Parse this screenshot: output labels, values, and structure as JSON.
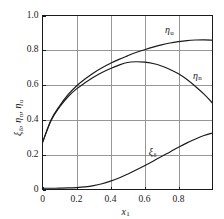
{
  "chart_data": {
    "type": "line",
    "title": "",
    "subtitle": "",
    "xlabel": "x₁",
    "ylabel": "ξδ, ηn, ηu",
    "xlim": [
      0,
      1
    ],
    "ylim": [
      0,
      1
    ],
    "grid": true,
    "legend_position": "inline-curve-labels",
    "xticks": [
      "0",
      "0.2",
      "0.4",
      "0.6",
      "0.8"
    ],
    "xtick_values": [
      0,
      0.2,
      0.4,
      0.6,
      0.8
    ],
    "yticks": [
      "0",
      "0.2",
      "0.4",
      "0.6",
      "0.8",
      "1.0"
    ],
    "ytick_values": [
      0,
      0.2,
      0.4,
      0.6,
      0.8,
      1.0
    ],
    "x": [
      0,
      0.05,
      0.1,
      0.15,
      0.2,
      0.25,
      0.3,
      0.35,
      0.4,
      0.45,
      0.5,
      0.55,
      0.6,
      0.65,
      0.7,
      0.75,
      0.8,
      0.85,
      0.9,
      0.95,
      1.0
    ],
    "series": [
      {
        "name": "ηu",
        "label": "η",
        "label_sub": "u",
        "values": [
          0.27,
          0.4,
          0.48,
          0.545,
          0.595,
          0.635,
          0.67,
          0.7,
          0.725,
          0.748,
          0.768,
          0.787,
          0.803,
          0.818,
          0.831,
          0.842,
          0.85,
          0.856,
          0.859,
          0.86,
          0.858
        ]
      },
      {
        "name": "ηn",
        "label": "η",
        "label_sub": "n",
        "values": [
          0.27,
          0.395,
          0.473,
          0.533,
          0.578,
          0.613,
          0.645,
          0.672,
          0.695,
          0.715,
          0.73,
          0.734,
          0.732,
          0.724,
          0.71,
          0.69,
          0.665,
          0.632,
          0.592,
          0.548,
          0.497
        ]
      },
      {
        "name": "ξδ",
        "label": "ξ",
        "label_sub": "δ",
        "values": [
          0.007,
          0.007,
          0.008,
          0.009,
          0.011,
          0.015,
          0.022,
          0.033,
          0.048,
          0.066,
          0.088,
          0.112,
          0.137,
          0.163,
          0.19,
          0.216,
          0.243,
          0.268,
          0.29,
          0.31,
          0.325
        ]
      }
    ],
    "curve_annotations": [
      {
        "name": "eta-u",
        "text": "η",
        "sub": "u",
        "x": 0.72,
        "y": 0.915
      },
      {
        "name": "eta-n",
        "text": "η",
        "sub": "n",
        "x": 0.885,
        "y": 0.655
      },
      {
        "name": "xi-delta",
        "text": "ξ",
        "sub": "δ",
        "x": 0.625,
        "y": 0.215
      }
    ],
    "colors": {
      "curve": "#1a1a1a",
      "frame": "#1a1a1a",
      "grid": "#8c8c8c",
      "background": "#ffffff",
      "text": "#1a1a1a"
    }
  },
  "axis": {
    "y_title_parts": {
      "p1": "ξ",
      "s1": "δ",
      "sep1": ", ",
      "p2": "η",
      "s2": "n",
      "sep2": ", ",
      "p3": "η",
      "s3": "u"
    },
    "x_title_parts": {
      "p1": "x",
      "s1": "1"
    }
  }
}
